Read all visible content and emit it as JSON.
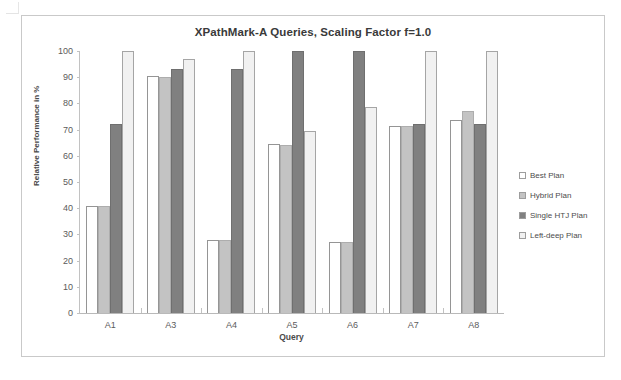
{
  "chart_data": {
    "type": "bar",
    "title": "XPathMark-A  Queries, Scaling Factor f=1.0",
    "xlabel": "Query",
    "ylabel": "Relative Performance in %",
    "ylim": [
      0,
      100
    ],
    "yticks": [
      0,
      10,
      20,
      30,
      40,
      50,
      60,
      70,
      80,
      90,
      100
    ],
    "grid": false,
    "legend_position": "right",
    "categories": [
      "A1",
      "A3",
      "A4",
      "A5",
      "A6",
      "A7",
      "A8"
    ],
    "series": [
      {
        "name": "Best Plan",
        "color": "#ffffff",
        "values": [
          41,
          90.5,
          28,
          64.5,
          27,
          71.5,
          73.5
        ]
      },
      {
        "name": "Hybrid Plan",
        "color": "#c3c3c3",
        "values": [
          41,
          90,
          28,
          64,
          27,
          71.5,
          77
        ]
      },
      {
        "name": "Single HTJ Plan",
        "color": "#808080",
        "values": [
          72,
          93,
          93,
          100,
          100,
          72,
          72
        ]
      },
      {
        "name": "Left-deep Plan",
        "color": "#f1f1f1",
        "values": [
          100,
          97,
          100,
          69.5,
          78.5,
          100,
          100
        ]
      }
    ]
  }
}
